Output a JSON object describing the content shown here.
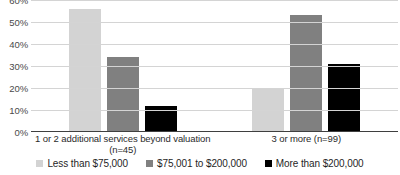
{
  "chart_data": {
    "type": "bar",
    "title": "",
    "subtitle": "",
    "xlabel": "",
    "ylabel": "",
    "ylim": [
      0,
      60
    ],
    "ytick_values": [
      60,
      50,
      40,
      30,
      20,
      10,
      0
    ],
    "ytick_labels": [
      "60%",
      "50%",
      "40%",
      "30%",
      "20%",
      "10%",
      "0%"
    ],
    "grid": true,
    "grid_axis": "y",
    "legend_position": "bottom",
    "categories": [
      "1 or 2 additional services beyond valuation (n=45)",
      "3 or more (n=99)"
    ],
    "category_lines": [
      [
        "1 or 2 additional services beyond valuation",
        "(n=45)"
      ],
      [
        "3 or more (n=99)",
        ""
      ]
    ],
    "series": [
      {
        "name": "Less than $75,000",
        "color": "#d3d3d3",
        "values": [
          56,
          20
        ]
      },
      {
        "name": "$75,001 to $200,000",
        "color": "#808080",
        "values": [
          34,
          53
        ]
      },
      {
        "name": "More than $200,000",
        "color": "#000000",
        "values": [
          12,
          31
        ]
      }
    ]
  },
  "legend": {
    "items": [
      {
        "label": "Less than $75,000"
      },
      {
        "label": "$75,001 to $200,000"
      },
      {
        "label": "More than $200,000"
      }
    ]
  }
}
